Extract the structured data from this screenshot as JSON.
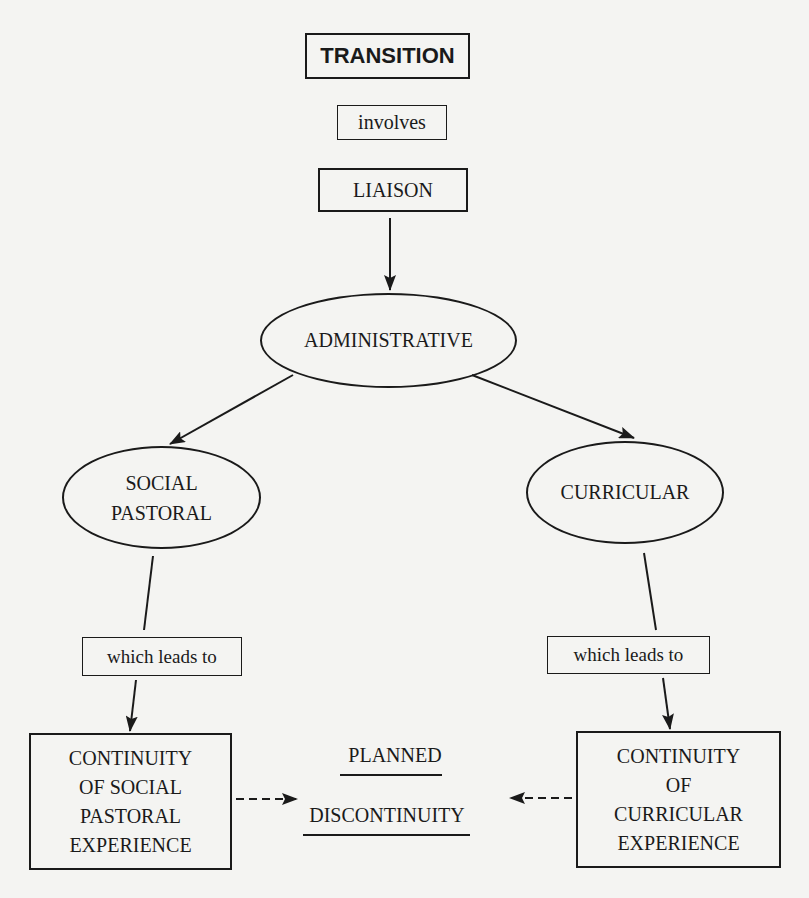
{
  "diagram": {
    "nodes": {
      "transition": "TRANSITION",
      "involves": "involves",
      "liaison": "LIAISON",
      "administrative": "ADMINISTRATIVE",
      "social_pastoral_line1": "SOCIAL",
      "social_pastoral_line2": "PASTORAL",
      "curricular": "CURRICULAR",
      "which_leads_to_left": "which leads to",
      "which_leads_to_right": "which leads to",
      "continuity_social": [
        "CONTINUITY",
        "OF SOCIAL",
        "PASTORAL",
        "EXPERIENCE"
      ],
      "continuity_curricular": [
        "CONTINUITY",
        "OF",
        "CURRICULAR",
        "EXPERIENCE"
      ],
      "planned": "PLANNED",
      "discontinuity": "DISCONTINUITY"
    },
    "edges": [
      {
        "from": "transition",
        "to": "involves",
        "style": "none"
      },
      {
        "from": "involves",
        "to": "liaison",
        "style": "none"
      },
      {
        "from": "liaison",
        "to": "administrative",
        "style": "solid-arrow"
      },
      {
        "from": "administrative",
        "to": "social_pastoral",
        "style": "solid-arrow"
      },
      {
        "from": "administrative",
        "to": "curricular",
        "style": "solid-arrow"
      },
      {
        "from": "social_pastoral",
        "to": "which_leads_to_left",
        "style": "solid-line"
      },
      {
        "from": "which_leads_to_left",
        "to": "continuity_social",
        "style": "solid-arrow"
      },
      {
        "from": "curricular",
        "to": "which_leads_to_right",
        "style": "solid-line"
      },
      {
        "from": "which_leads_to_right",
        "to": "continuity_curricular",
        "style": "solid-arrow"
      },
      {
        "from": "continuity_social",
        "to": "planned_discontinuity",
        "style": "dashed-arrow"
      },
      {
        "from": "continuity_curricular",
        "to": "planned_discontinuity",
        "style": "dashed-arrow"
      }
    ],
    "colors": {
      "ink": "#1a1a1a",
      "paper": "#f4f4f2"
    }
  }
}
